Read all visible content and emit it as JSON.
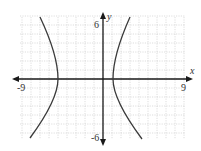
{
  "chart_data": {
    "type": "line",
    "title": "",
    "xlabel": "x",
    "ylabel": "y",
    "xlim": [
      -9,
      9
    ],
    "ylim": [
      -6,
      6
    ],
    "x_tick_labels": [
      "-9",
      "9"
    ],
    "y_tick_labels": [
      "6",
      "-6"
    ],
    "grid": true,
    "grid_step": 1,
    "series": [
      {
        "name": "hyperbola",
        "center": [
          -2,
          0
        ],
        "vertices": [
          [
            -5,
            0
          ],
          [
            1,
            0
          ]
        ],
        "branches": [
          {
            "name": "left-branch",
            "points": [
              [
                -7,
                6.9
              ],
              [
                -6,
                4.2
              ],
              [
                -5.3,
                2
              ],
              [
                -5,
                0
              ],
              [
                -5.4,
                -2
              ],
              [
                -6.3,
                -4.2
              ],
              [
                -8.1,
                -6.6
              ]
            ]
          },
          {
            "name": "right-branch",
            "points": [
              [
                3,
                6.9
              ],
              [
                2,
                4.2
              ],
              [
                1.3,
                2
              ],
              [
                1,
                0
              ],
              [
                1.4,
                -2
              ],
              [
                2.3,
                -4.2
              ],
              [
                4.2,
                -6.6
              ]
            ]
          }
        ]
      }
    ]
  },
  "labels": {
    "x_axis": "x",
    "y_axis": "y",
    "x_min": "-9",
    "x_max": "9",
    "y_max": "6",
    "y_min": "-6"
  },
  "colors": {
    "axis": "#1a1a1a",
    "curve": "#3a3a3a",
    "grid": "#c8c8c8",
    "text": "#333333"
  }
}
